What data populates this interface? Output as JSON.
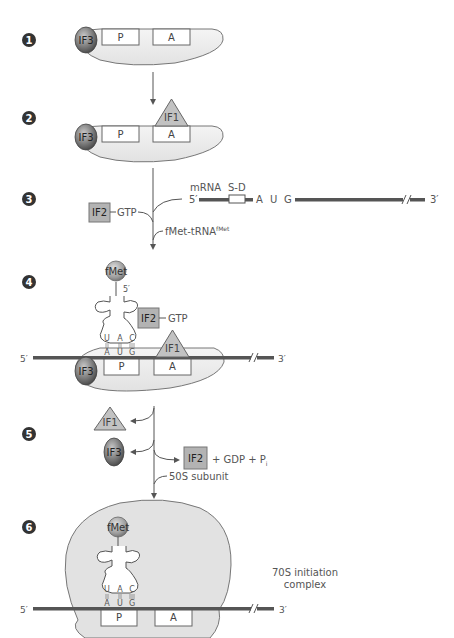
{
  "figure": {
    "colors": {
      "ribosome_fill": "#e6e6e6",
      "ribosome_stroke": "#777777",
      "mrna": "#555555",
      "if2_fill": "#b3b3b3",
      "if1_fill": "#c2c2c2",
      "if3_fill": "#7a7a7a",
      "fmet_fill": "#9a9a9a",
      "step_circle": "#333333",
      "arrow": "#555555",
      "text": "#555555"
    },
    "steps": [
      {
        "number": "1",
        "sites": [
          "P",
          "A"
        ],
        "factors": [
          "IF3"
        ]
      },
      {
        "number": "2",
        "sites": [
          "P",
          "A"
        ],
        "factors": [
          "IF3",
          "IF1"
        ]
      },
      {
        "number": "3",
        "mrna_label": "mRNA",
        "sd_label": "S-D",
        "five_prime": "5′",
        "three_prime": "3′",
        "codon": [
          "A",
          "U",
          "G"
        ],
        "if2_label": "IF2",
        "gtp_label": "GTP",
        "trna_label": "fMet-tRNA",
        "trna_superscript": "fMet"
      },
      {
        "number": "4",
        "fmet_label": "fMet",
        "trna_five_prime": "5′",
        "anticodon": [
          "U",
          "A",
          "C"
        ],
        "codon": [
          "A",
          "U",
          "G"
        ],
        "if2_label": "IF2",
        "gtp_label": "GTP",
        "if1_label": "IF1",
        "if3_label": "IF3",
        "sites": [
          "P",
          "A"
        ],
        "five_prime": "5′",
        "three_prime": "3′"
      },
      {
        "number": "5",
        "released": [
          "IF1",
          "IF3"
        ],
        "if2_label": "IF2",
        "products_label": "+ GDP + P",
        "products_subscript": "i",
        "subunit_label": "50S subunit"
      },
      {
        "number": "6",
        "fmet_label": "fMet",
        "anticodon": [
          "U",
          "A",
          "C"
        ],
        "codon": [
          "A",
          "U",
          "G"
        ],
        "sites": [
          "P",
          "A"
        ],
        "five_prime": "5′",
        "three_prime": "3′",
        "complex_label_line1": "70S initiation",
        "complex_label_line2": "complex"
      }
    ]
  }
}
